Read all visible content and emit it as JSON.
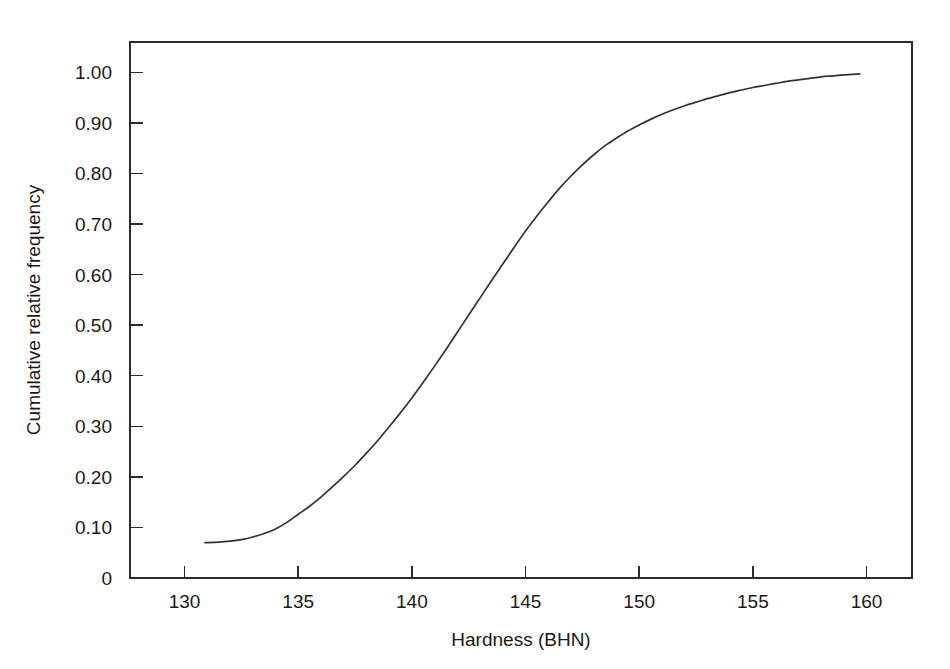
{
  "chart_data": {
    "type": "line",
    "title": "",
    "subtitle": "",
    "xlabel": "Hardness (BHN)",
    "ylabel": "Cumulative relative frequency",
    "xlim": [
      127.6,
      162.0
    ],
    "ylim": [
      0,
      1.06
    ],
    "grid": false,
    "legend": null,
    "x_ticks": [
      130,
      135,
      140,
      145,
      150,
      155,
      160
    ],
    "x_tick_labels": [
      "130",
      "135",
      "140",
      "145",
      "150",
      "155",
      "160"
    ],
    "y_ticks": [
      0,
      0.1,
      0.2,
      0.3,
      0.4,
      0.5,
      0.6,
      0.7,
      0.8,
      0.9,
      1.0
    ],
    "y_tick_labels": [
      "0",
      "0.10",
      "0.20",
      "0.30",
      "0.40",
      "0.50",
      "0.60",
      "0.70",
      "0.80",
      "0.90",
      "1.00"
    ],
    "series": [
      {
        "name": "Cumulative relative frequency",
        "color": "#333333",
        "x": [
          130.9,
          131.5,
          132.0,
          132.5,
          133.0,
          133.5,
          134.0,
          134.5,
          135.0,
          135.5,
          136.0,
          136.5,
          137.0,
          137.5,
          138.0,
          138.5,
          139.0,
          139.5,
          140.0,
          140.5,
          141.0,
          141.5,
          142.0,
          142.5,
          143.0,
          143.5,
          144.0,
          144.5,
          145.0,
          145.5,
          146.0,
          146.5,
          147.0,
          147.5,
          148.0,
          148.5,
          149.0,
          149.5,
          150.0,
          150.5,
          151.0,
          151.5,
          152.0,
          152.5,
          153.0,
          153.5,
          154.0,
          154.5,
          155.0,
          155.5,
          156.0,
          156.5,
          157.0,
          157.5,
          158.0,
          158.5,
          159.0,
          159.7
        ],
        "y": [
          0.07,
          0.071,
          0.073,
          0.076,
          0.081,
          0.088,
          0.097,
          0.11,
          0.126,
          0.142,
          0.16,
          0.18,
          0.201,
          0.223,
          0.247,
          0.272,
          0.299,
          0.327,
          0.356,
          0.387,
          0.419,
          0.452,
          0.486,
          0.52,
          0.554,
          0.588,
          0.621,
          0.654,
          0.686,
          0.716,
          0.744,
          0.771,
          0.795,
          0.817,
          0.837,
          0.855,
          0.87,
          0.884,
          0.896,
          0.907,
          0.917,
          0.926,
          0.934,
          0.941,
          0.948,
          0.954,
          0.96,
          0.965,
          0.97,
          0.974,
          0.978,
          0.982,
          0.985,
          0.988,
          0.991,
          0.993,
          0.995,
          0.997
        ]
      }
    ],
    "annotations": []
  },
  "figure": {
    "background_color": "#ffffff",
    "frame_color": "#2b2b2b",
    "curve_color": "#333333"
  }
}
